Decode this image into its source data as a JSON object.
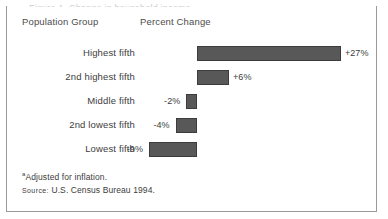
{
  "figure": {
    "clipped_title": "Figure 1. Change in household income",
    "headers": {
      "group": "Population Group",
      "percent": "Percent Change"
    },
    "footnotes": {
      "marker": "a",
      "note": "Adjusted for inflation.",
      "source_label": "Source:",
      "source_text": "U.S. Census Bureau 1994."
    },
    "colors": {
      "bar_fill": "#585858",
      "bar_stroke": "#3c3c3c",
      "frame": "#9a9a9a",
      "text": "#3d3d3d"
    }
  },
  "chart_data": {
    "type": "bar",
    "orientation": "horizontal",
    "title": "",
    "xlabel": "Percent Change",
    "ylabel": "Population Group",
    "categories": [
      "Highest fifth",
      "2nd highest fifth",
      "Middle fifth",
      "2nd lowest fifth",
      "Lowest fifth"
    ],
    "values": [
      27,
      6,
      -2,
      -4,
      -9
    ],
    "value_labels": [
      "+27%",
      "+6%",
      "-2%",
      "-4%",
      "-9%"
    ],
    "unit": "%",
    "baseline": 0,
    "xlim": [
      -12,
      30
    ],
    "grid": false,
    "legend": null,
    "axis_visible": false
  }
}
